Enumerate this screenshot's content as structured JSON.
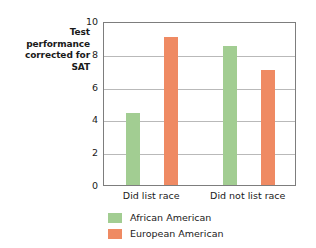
{
  "chart_data": {
    "type": "bar",
    "title": "",
    "subtitle": "",
    "xlabel": "",
    "ylabel": "Test performance corrected for SAT",
    "ylim": [
      0,
      10
    ],
    "yticks": [
      0,
      2,
      4,
      6,
      8,
      10
    ],
    "ytick_labels": [
      "0",
      "2",
      "4",
      "6",
      "8",
      "10"
    ],
    "grid": true,
    "legend_position": "bottom-left",
    "categories": [
      "Did list race",
      "Did not list race"
    ],
    "series": [
      {
        "name": "African American",
        "color": "#a2cd92",
        "values": [
          4.4,
          8.45
        ]
      },
      {
        "name": "European American",
        "color": "#ef8a63",
        "values": [
          9.0,
          7.0
        ]
      }
    ]
  },
  "axes": {
    "y_title_lines": [
      "Test",
      "performance",
      "corrected for",
      "SAT"
    ],
    "frame_color": "#7d7d7d",
    "gridline_color": "#b9b9b9"
  }
}
